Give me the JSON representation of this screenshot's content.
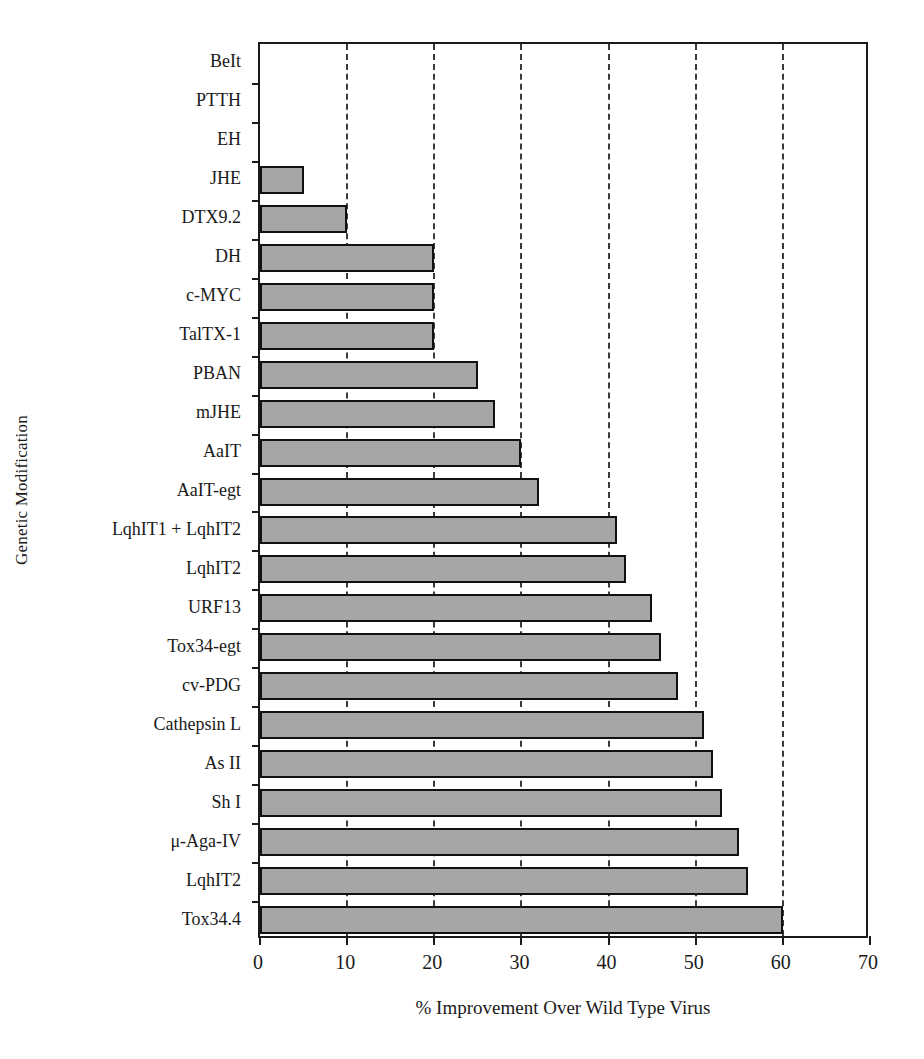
{
  "chart_data": {
    "type": "bar",
    "orientation": "horizontal",
    "title": "",
    "xlabel": "% Improvement Over Wild Type Virus",
    "ylabel": "Genetic Modification",
    "xlim": [
      0,
      70
    ],
    "xticks": [
      0,
      10,
      20,
      30,
      40,
      50,
      60,
      70
    ],
    "gridlines": [
      10,
      20,
      30,
      40,
      50,
      60
    ],
    "grid": "vertical-dashed",
    "legend": "none",
    "bar_color": "#a6a6a6",
    "bar_edge_color": "#111111",
    "categories": [
      "BeIt",
      "PTTH",
      "EH",
      "JHE",
      "DTX9.2",
      "DH",
      "c-MYC",
      "TalTX-1",
      "PBAN",
      "mJHE",
      "AaIT",
      "AaIT-egt",
      "LqhIT1 + LqhIT2",
      "LqhIT2",
      "URF13",
      "Tox34-egt",
      "cv-PDG",
      "Cathepsin L",
      "As II",
      "Sh I",
      "μ-Aga-IV",
      "LqhIT2",
      "Tox34.4"
    ],
    "values": [
      0,
      0,
      0,
      5,
      10,
      20,
      20,
      20,
      25,
      27,
      30,
      32,
      41,
      42,
      45,
      46,
      48,
      51,
      52,
      53,
      55,
      56,
      60
    ]
  }
}
